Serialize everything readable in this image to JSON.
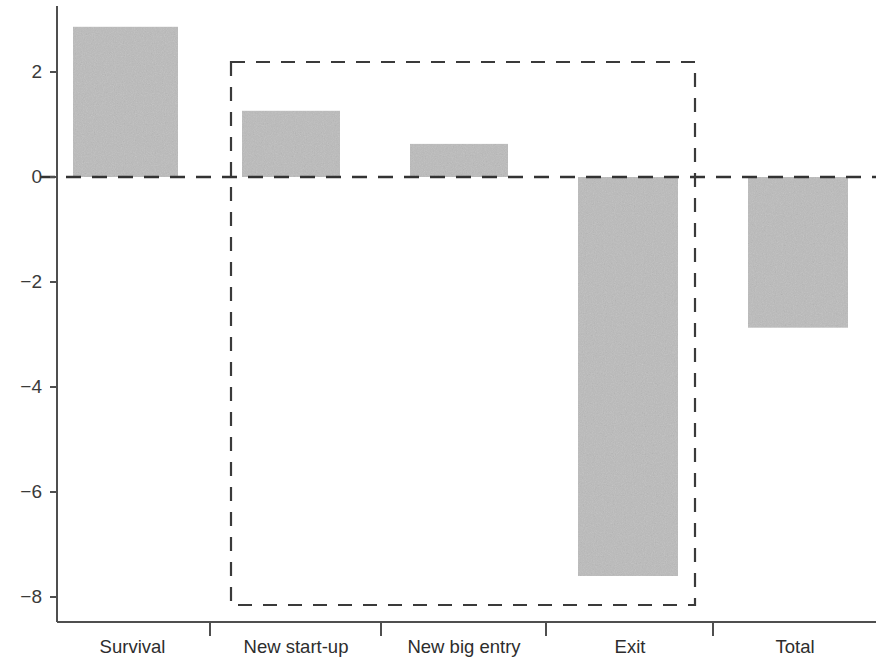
{
  "chart_data": {
    "type": "bar",
    "title": "",
    "subtitle": "",
    "xlabel": "",
    "ylabel": "",
    "categories": [
      "Survival",
      "New start-up",
      "New big entry",
      "Exit",
      "Total"
    ],
    "values": [
      2.86,
      1.26,
      0.63,
      -7.6,
      -2.87
    ],
    "series": [
      {
        "name": "Contribution",
        "values": [
          2.86,
          1.26,
          0.63,
          -7.6,
          -2.87
        ]
      }
    ],
    "ylim": [
      -8.6,
      3.1
    ],
    "yticks": [
      2,
      0,
      -2,
      -4,
      -6,
      -8
    ],
    "ytick_labels": [
      "2",
      "0",
      "−2",
      "−4",
      "−6",
      "−8"
    ],
    "grid": false,
    "legend": null,
    "zero_line": {
      "value": 0,
      "style": "dashed",
      "color": "#333333"
    },
    "annotations": [
      {
        "type": "dashed-rectangle",
        "encloses": [
          "New start-up",
          "New big entry",
          "Exit"
        ],
        "y_top": 2.19,
        "y_bottom": -8.15,
        "style": "dashed",
        "color": "#3a3a3a"
      }
    ],
    "bar_color": "#c4c4c4",
    "axis_color": "#555555"
  },
  "axis": {
    "y_ticks": [
      {
        "label": "2",
        "value": 2
      },
      {
        "label": "0",
        "value": 0
      },
      {
        "label": "−2",
        "value": -2
      },
      {
        "label": "−4",
        "value": -4
      },
      {
        "label": "−6",
        "value": -6
      },
      {
        "label": "−8",
        "value": -8
      }
    ],
    "x_categories": [
      {
        "label": "Survival"
      },
      {
        "label": "New start-up"
      },
      {
        "label": "New big entry"
      },
      {
        "label": "Exit"
      },
      {
        "label": "Total"
      }
    ]
  },
  "colors": {
    "bar_fill": "#c4c4c4",
    "axis": "#555555",
    "dash": "#3a3a3a",
    "text": "#2d2d2d",
    "background": "#ffffff"
  }
}
